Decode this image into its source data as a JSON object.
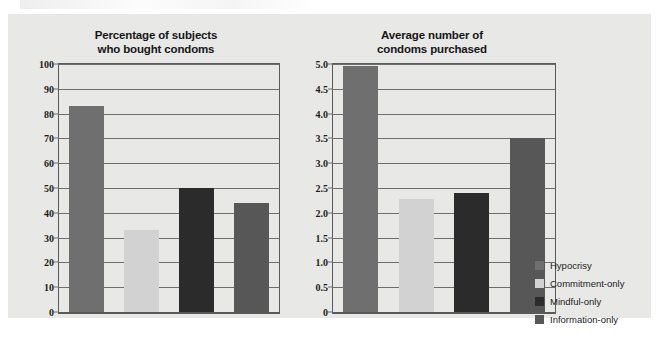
{
  "figure": {
    "background_color": "#ffffff",
    "card_color": "#e8e8e6"
  },
  "legend": {
    "position": "right",
    "entries": [
      {
        "label": "Hypocrisy",
        "color": "#6f6f6f"
      },
      {
        "label": "Commitment-only",
        "color": "#d2d2d2"
      },
      {
        "label": "Mindful-only",
        "color": "#2b2b2b"
      },
      {
        "label": "Information-only",
        "color": "#575757"
      }
    ]
  },
  "chart_data": [
    {
      "type": "bar",
      "title": "Percentage of subjects who bought condoms",
      "title_lines": [
        "Percentage of subjects",
        "who bought condoms"
      ],
      "xlabel": "",
      "ylabel": "",
      "ylim": [
        0,
        100
      ],
      "yticks": [
        0,
        10,
        20,
        30,
        40,
        50,
        60,
        70,
        80,
        90,
        100
      ],
      "ytick_labels": [
        "0",
        "10",
        "20",
        "30",
        "40",
        "50",
        "60",
        "70",
        "80",
        "90",
        "100"
      ],
      "grid": true,
      "categories": [
        "Hypocrisy",
        "Commitment-only",
        "Mindful-only",
        "Information-only"
      ],
      "values": [
        83,
        33,
        50,
        44
      ],
      "colors": [
        "#6f6f6f",
        "#d2d2d2",
        "#2b2b2b",
        "#575757"
      ]
    },
    {
      "type": "bar",
      "title": "Average number of condoms purchased",
      "title_lines": [
        "Average number of",
        "condoms purchased"
      ],
      "xlabel": "",
      "ylabel": "",
      "ylim": [
        0,
        5.0
      ],
      "yticks": [
        0,
        0.5,
        1.0,
        1.5,
        2.0,
        2.5,
        3.0,
        3.5,
        4.0,
        4.5,
        5.0
      ],
      "ytick_labels": [
        "0",
        "0.5",
        "1.0",
        "1.5",
        "2.0",
        "2.5",
        "3.0",
        "3.5",
        "4.0",
        "4.5",
        "5.0"
      ],
      "grid": true,
      "categories": [
        "Hypocrisy",
        "Commitment-only",
        "Mindful-only",
        "Information-only"
      ],
      "values": [
        4.95,
        2.27,
        2.4,
        3.5
      ],
      "colors": [
        "#6f6f6f",
        "#d2d2d2",
        "#2b2b2b",
        "#575757"
      ]
    }
  ]
}
